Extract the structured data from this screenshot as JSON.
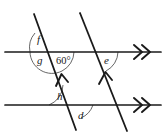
{
  "figure": {
    "stroke_color": "#1a1a1a",
    "arc_color": "#555555",
    "background": "#ffffff",
    "line_width": 1.6,
    "arc_width": 0.9
  },
  "lines": {
    "horizontal_top": {
      "name": "top-parallel-line",
      "x1": 5,
      "y1": 52,
      "x2": 163,
      "y2": 52,
      "marker": "double-chevron-right"
    },
    "horizontal_bottom": {
      "name": "bottom-parallel-line",
      "x1": 5,
      "y1": 105,
      "x2": 163,
      "y2": 105,
      "marker": "double-chevron-right"
    },
    "transversal_left": {
      "name": "left-transversal-line",
      "x1": 34,
      "y1": 14,
      "x2": 76,
      "y2": 130,
      "marker": "single-chevron-up"
    },
    "transversal_right": {
      "name": "right-transversal-line",
      "x1": 80,
      "y1": 13,
      "x2": 127,
      "y2": 131,
      "marker": "single-chevron-up"
    }
  },
  "intersections": {
    "top_left": {
      "x": 52,
      "y": 52
    },
    "top_right": {
      "x": 96,
      "y": 52
    },
    "bottom_left": {
      "x": 71,
      "y": 105
    },
    "bottom_right": {
      "x": 118,
      "y": 105
    }
  },
  "angle_labels": [
    {
      "id": "f",
      "text": "f",
      "x": 37,
      "y": 43,
      "vertex": "top_left",
      "position": "above-left"
    },
    {
      "id": "g",
      "text": "g",
      "x": 37,
      "y": 64,
      "vertex": "top_left",
      "position": "below-left"
    },
    {
      "id": "a60",
      "text": "60°",
      "x": 56,
      "y": 64,
      "vertex": "top_left",
      "position": "below-right"
    },
    {
      "id": "e",
      "text": "e",
      "x": 104,
      "y": 64,
      "vertex": "top_right",
      "position": "below-right"
    },
    {
      "id": "h",
      "text": "h",
      "x": 57,
      "y": 100,
      "vertex": "bottom_left",
      "position": "above-right"
    },
    {
      "id": "d",
      "text": "d",
      "x": 78,
      "y": 119,
      "vertex": "bottom_left",
      "position": "below-right"
    }
  ],
  "arcs": [
    {
      "id": "arc-f",
      "d": "M 35 33 A 22 22 0 0 0 30 52"
    },
    {
      "id": "arc-g",
      "d": "M 30 52 A 22 22 0 0 0 62 71"
    },
    {
      "id": "arc-60",
      "d": "M 62 71 A 22 22 0 0 0 74 52"
    },
    {
      "id": "arc-e",
      "d": "M 106 71 A 22 22 0 0 0 118 52"
    },
    {
      "id": "arc-h",
      "d": "M 49 105 A 22 22 0 0 0 63 85"
    },
    {
      "id": "arc-d",
      "d": "M 81 118 A 22 22 0 0 0 93 105"
    }
  ],
  "markers": {
    "horizontal_arrow_label": "double-chevron",
    "transversal_arrow_label": "single-chevron"
  }
}
